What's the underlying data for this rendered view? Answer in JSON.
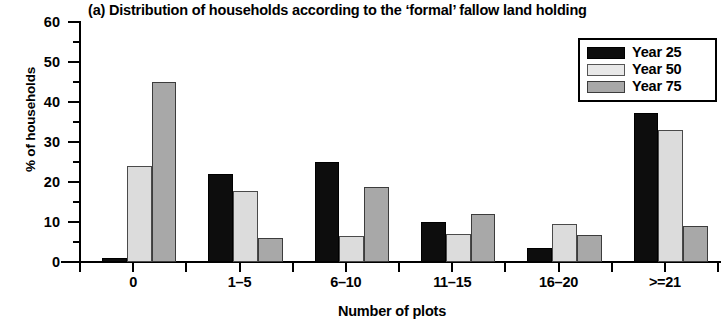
{
  "chart_data": {
    "type": "bar",
    "title": "(a) Distribution of households according to the ‘formal’ fallow land holding",
    "xlabel": "Number of plots",
    "ylabel": "% of households",
    "categories": [
      "0",
      "1–5",
      "6–10",
      "11–15",
      "16–20",
      ">=21"
    ],
    "series": [
      {
        "name": "Year 25",
        "color": "#0d0d0d",
        "values": [
          1,
          22,
          25,
          10,
          3.5,
          37.3
        ]
      },
      {
        "name": "Year 50",
        "color": "#dcdcdc",
        "values": [
          24,
          17.8,
          6.5,
          7,
          9.5,
          33
        ]
      },
      {
        "name": "Year 75",
        "color": "#a8a8a8",
        "values": [
          45,
          6,
          18.8,
          12,
          6.8,
          9
        ]
      }
    ],
    "ylim": [
      0,
      60
    ],
    "yticks": [
      0,
      10,
      20,
      30,
      40,
      50,
      60
    ],
    "yticks_minor": [
      5,
      15,
      25,
      35,
      45,
      55
    ],
    "grid": false,
    "legend_position": "top-right"
  },
  "legend": {
    "entries": [
      {
        "label": "Year 25"
      },
      {
        "label": "Year 50"
      },
      {
        "label": "Year 75"
      }
    ]
  }
}
